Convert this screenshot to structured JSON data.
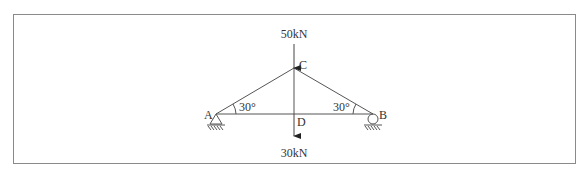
{
  "diagram": {
    "type": "truss",
    "nodes": [
      {
        "id": "A",
        "label": "A",
        "x": 216,
        "y": 114,
        "support": "pin"
      },
      {
        "id": "B",
        "label": "B",
        "x": 373,
        "y": 114,
        "support": "roller"
      },
      {
        "id": "C",
        "label": "C",
        "x": 294,
        "y": 68
      },
      {
        "id": "D",
        "label": "D",
        "x": 294,
        "y": 114
      }
    ],
    "members": [
      {
        "from": "A",
        "to": "C"
      },
      {
        "from": "C",
        "to": "B"
      },
      {
        "from": "A",
        "to": "B"
      },
      {
        "from": "C",
        "to": "D"
      }
    ],
    "loads": {
      "top": {
        "label": "50kN",
        "node": "C",
        "direction": "down"
      },
      "bottom": {
        "label": "30kN",
        "node": "D",
        "direction": "down"
      }
    },
    "angles": {
      "at_a": "30°",
      "at_b": "30°"
    }
  }
}
